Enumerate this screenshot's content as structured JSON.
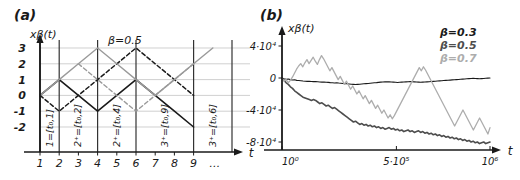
{
  "figure": {
    "panels": [
      {
        "tag": "(a)",
        "type": "schematic-walk",
        "ylabel": "xβ(t)",
        "xlabel": "t",
        "annotation": "β=0.5",
        "y_ticks": [
          "3",
          "2",
          "1",
          "0",
          "-1",
          "-2"
        ],
        "y_tick_values": [
          3,
          2,
          1,
          0,
          -1,
          -2
        ],
        "x_ticks": [
          "1",
          "2",
          "3",
          "4",
          "5",
          "6",
          "7",
          "8",
          "9",
          "…"
        ],
        "x_tick_values": [
          1,
          2,
          3,
          4,
          5,
          6,
          7,
          8,
          9
        ],
        "interval_labels": [
          "1=[t₀,1]",
          "2⁺=[t₀,2]",
          "2⁺=[t₀,4]",
          "3⁺=[t₀,9]",
          "3⁺=[t₀,6]"
        ],
        "interval_boundaries": [
          1,
          2,
          4,
          6,
          9,
          11
        ],
        "series": [
          {
            "name": "solid-black-walk",
            "style": "solid",
            "color": "#1a1a1a",
            "width": 1.6,
            "points": [
              [
                1,
                0
              ],
              [
                2,
                1
              ],
              [
                3,
                0
              ],
              [
                4,
                -1
              ],
              [
                5,
                0
              ],
              [
                6,
                1
              ],
              [
                7,
                0
              ],
              [
                8,
                -1
              ],
              [
                9,
                -2
              ]
            ]
          },
          {
            "name": "dashed-black-walk",
            "style": "dashed",
            "color": "#1a1a1a",
            "width": 1.5,
            "points": [
              [
                1,
                0
              ],
              [
                2,
                -1
              ],
              [
                3,
                0
              ],
              [
                4,
                1
              ],
              [
                5,
                2
              ],
              [
                6,
                3
              ],
              [
                7,
                2
              ],
              [
                8,
                1
              ],
              [
                9,
                0
              ]
            ]
          },
          {
            "name": "solid-gray-walk",
            "style": "solid",
            "color": "#9a9a9a",
            "width": 1.4,
            "points": [
              [
                1,
                0
              ],
              [
                2,
                1
              ],
              [
                3,
                2
              ],
              [
                4,
                3
              ],
              [
                5,
                2
              ],
              [
                6,
                1
              ],
              [
                7,
                0
              ],
              [
                8,
                1
              ],
              [
                9,
                2
              ],
              [
                10,
                3
              ]
            ]
          },
          {
            "name": "dashed-gray-walk",
            "style": "dashed",
            "color": "#9a9a9a",
            "width": 1.4,
            "points": [
              [
                3,
                2
              ],
              [
                4,
                1
              ],
              [
                5,
                0
              ],
              [
                6,
                -1
              ],
              [
                7,
                0
              ],
              [
                8,
                1
              ],
              [
                9,
                2
              ]
            ]
          }
        ]
      },
      {
        "tag": "(b)",
        "type": "line",
        "ylabel": "xβ(t)",
        "xlabel": "t",
        "y_ticks": [
          "4·10⁴",
          "0",
          "-4·10⁴",
          "-8·10⁴"
        ],
        "y_tick_values": [
          40000,
          0,
          -40000,
          -80000
        ],
        "ylim": [
          -90000,
          50000
        ],
        "x_ticks": [
          "10⁰",
          "5·10⁵",
          "10⁶"
        ],
        "x_tick_values": [
          1,
          500000,
          1000000
        ],
        "xlim": [
          1,
          1000000
        ],
        "legend": [
          {
            "label": "β=0.3",
            "color": "#1a1a1a"
          },
          {
            "label": "β=0.5",
            "color": "#4d4d4d"
          },
          {
            "label": "β=0.7",
            "color": "#adadad"
          }
        ],
        "legend_position": "top-right",
        "grid": false,
        "series": [
          {
            "name": "beta-0.3",
            "color": "#1a1a1a",
            "width": 1.1,
            "values": [
              0,
              -1000,
              -1500,
              -1200,
              -2000,
              -2500,
              -2200,
              -3000,
              -3200,
              -3500,
              -3800,
              -4000,
              -4200,
              -4000,
              -4300,
              -4500,
              -4400,
              -4700,
              -5000,
              -5200,
              -5000,
              -5300,
              -5500,
              -5800,
              -6000,
              -6200,
              -6000,
              -6300,
              -6500,
              -6800,
              -7000,
              -7200,
              -7500,
              -7800,
              -8000,
              -8200,
              -8000,
              -7800,
              -7500,
              -7200,
              -7000,
              -6800,
              -6500,
              -6200,
              -6000,
              -5800,
              -5500,
              -5200,
              -5000,
              -4800,
              -4600,
              -4800,
              -5000,
              -5200,
              -5400,
              -5600,
              -5400,
              -5200,
              -5000,
              -4800,
              -4600,
              -4400,
              -4600,
              -4800,
              -5000,
              -5200,
              -5400,
              -5200,
              -5000,
              -4800,
              -4600,
              -4400,
              -4200,
              -4000,
              -3800,
              -3600,
              -3400,
              -3200,
              -3000,
              -2800,
              -2600,
              -2400,
              -2200,
              -2000,
              -1800,
              -1600,
              -1400,
              -1200,
              -1000,
              -800,
              -600,
              -400,
              -600,
              -800,
              -1000,
              -800,
              -600,
              -400,
              -200,
              0
            ]
          },
          {
            "name": "beta-0.5",
            "color": "#4d4d4d",
            "width": 1.6,
            "values": [
              0,
              -3000,
              -6000,
              -8000,
              -11000,
              -13000,
              -16000,
              -18000,
              -20000,
              -22000,
              -24000,
              -25000,
              -26000,
              -27000,
              -28000,
              -27000,
              -28000,
              -30000,
              -32000,
              -31000,
              -33000,
              -35000,
              -34000,
              -36000,
              -38000,
              -37000,
              -39000,
              -41000,
              -43000,
              -45000,
              -47000,
              -49000,
              -51000,
              -53000,
              -55000,
              -54000,
              -56000,
              -58000,
              -57000,
              -59000,
              -58000,
              -60000,
              -59000,
              -61000,
              -60000,
              -62000,
              -61000,
              -63000,
              -62000,
              -64000,
              -63000,
              -62000,
              -64000,
              -63000,
              -65000,
              -64000,
              -66000,
              -65000,
              -67000,
              -66000,
              -65000,
              -67000,
              -66000,
              -68000,
              -67000,
              -66000,
              -68000,
              -67000,
              -69000,
              -68000,
              -70000,
              -69000,
              -71000,
              -70000,
              -72000,
              -71000,
              -73000,
              -72000,
              -74000,
              -73000,
              -75000,
              -74000,
              -76000,
              -75000,
              -77000,
              -76000,
              -78000,
              -77000,
              -79000,
              -78000,
              -80000,
              -79000,
              -81000,
              -80000,
              -82000,
              -81000,
              -80000,
              -82000,
              -81000,
              -80000
            ]
          },
          {
            "name": "beta-0.7",
            "color": "#adadad",
            "width": 1.3,
            "values": [
              0,
              -4000,
              -2000,
              -6000,
              -3000,
              1000,
              6000,
              11000,
              15000,
              18000,
              14000,
              19000,
              23000,
              18000,
              22000,
              26000,
              21000,
              17000,
              23000,
              28000,
              24000,
              19000,
              14000,
              9000,
              13000,
              8000,
              3000,
              -2000,
              2000,
              -3000,
              -8000,
              -4000,
              -9000,
              -14000,
              -10000,
              -15000,
              -20000,
              -16000,
              -21000,
              -26000,
              -22000,
              -27000,
              -32000,
              -28000,
              -33000,
              -38000,
              -34000,
              -39000,
              -44000,
              -40000,
              -45000,
              -50000,
              -46000,
              -51000,
              -47000,
              -42000,
              -37000,
              -32000,
              -27000,
              -22000,
              -17000,
              -12000,
              -7000,
              -2000,
              3000,
              8000,
              13000,
              9000,
              14000,
              10000,
              5000,
              0,
              -5000,
              -10000,
              -15000,
              -20000,
              -25000,
              -30000,
              -35000,
              -40000,
              -45000,
              -50000,
              -55000,
              -60000,
              -55000,
              -50000,
              -45000,
              -40000,
              -45000,
              -50000,
              -55000,
              -60000,
              -65000,
              -60000,
              -55000,
              -50000,
              -55000,
              -60000,
              -65000,
              -70000,
              -62000
            ]
          }
        ]
      }
    ]
  }
}
